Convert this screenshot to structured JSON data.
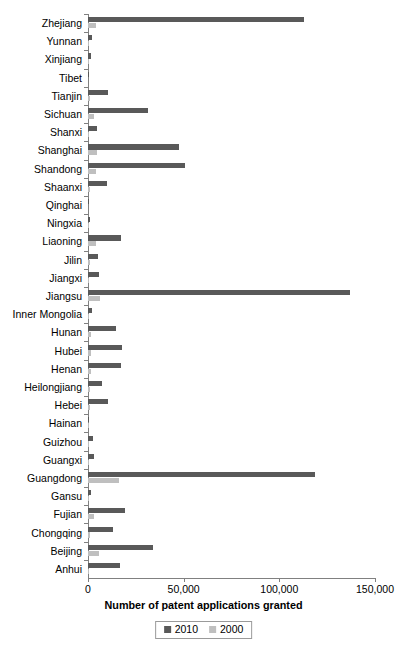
{
  "chart_data": {
    "type": "bar",
    "orientation": "horizontal",
    "title": "",
    "xlabel": "Number of patent applications granted",
    "ylabel": "",
    "xlim": [
      0,
      150000
    ],
    "xticks": [
      0,
      50000,
      100000,
      150000
    ],
    "xticklabels": [
      "0",
      "50,000",
      "100,000",
      "150,000"
    ],
    "grid": false,
    "legend_position": "bottom-center",
    "categories": [
      "Zhejiang",
      "Yunnan",
      "Xinjiang",
      "Tibet",
      "Tianjin",
      "Sichuan",
      "Shanxi",
      "Shanghai",
      "Shandong",
      "Shaanxi",
      "Qinghai",
      "Ningxia",
      "Liaoning",
      "Jilin",
      "Jiangxi",
      "Jiangsu",
      "Inner Mongolia",
      "Hunan",
      "Hubei",
      "Henan",
      "Heilongjiang",
      "Hebei",
      "Hainan",
      "Guizhou",
      "Guangxi",
      "Guangdong",
      "Gansu",
      "Fujian",
      "Chongqing",
      "Beijing",
      "Anhui"
    ],
    "series": [
      {
        "name": "2010",
        "color": "#595959",
        "values": [
          113000,
          2100,
          1800,
          300,
          10500,
          31500,
          4800,
          47500,
          50500,
          9800,
          200,
          1000,
          17500,
          5000,
          5500,
          137000,
          2000,
          14500,
          18000,
          17500,
          7500,
          10500,
          600,
          2400,
          3200,
          118500,
          1600,
          19500,
          13000,
          34000,
          16500
        ]
      },
      {
        "name": "2000",
        "color": "#bfbfbf",
        "values": [
          4300,
          700,
          600,
          30,
          1300,
          3300,
          500,
          4900,
          4200,
          900,
          40,
          150,
          4000,
          800,
          500,
          6500,
          300,
          1400,
          1400,
          1400,
          1100,
          1000,
          150,
          200,
          400,
          16000,
          200,
          3000,
          1200,
          5500,
          700
        ]
      }
    ]
  },
  "legend": {
    "items": [
      {
        "label": "2010",
        "color": "#595959"
      },
      {
        "label": "2000",
        "color": "#bfbfbf"
      }
    ]
  }
}
